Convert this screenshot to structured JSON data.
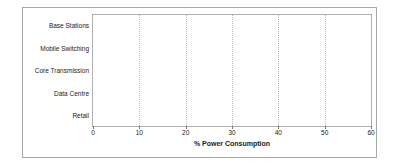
{
  "chart_data": {
    "type": "bar",
    "orientation": "horizontal",
    "title": "",
    "xlabel": "% Power Consumption",
    "ylabel": "",
    "xlim": [
      0,
      60
    ],
    "xticks": [
      0,
      10,
      20,
      30,
      40,
      50,
      60
    ],
    "grid": "vertical-dotted",
    "legend": "none",
    "categories": [
      "Base Stations",
      "Mobile Switching",
      "Core Transmission",
      "Data Centre",
      "Retail"
    ],
    "values": [
      57,
      20,
      15,
      6,
      3
    ],
    "bar_color": "#6e6e6e"
  }
}
